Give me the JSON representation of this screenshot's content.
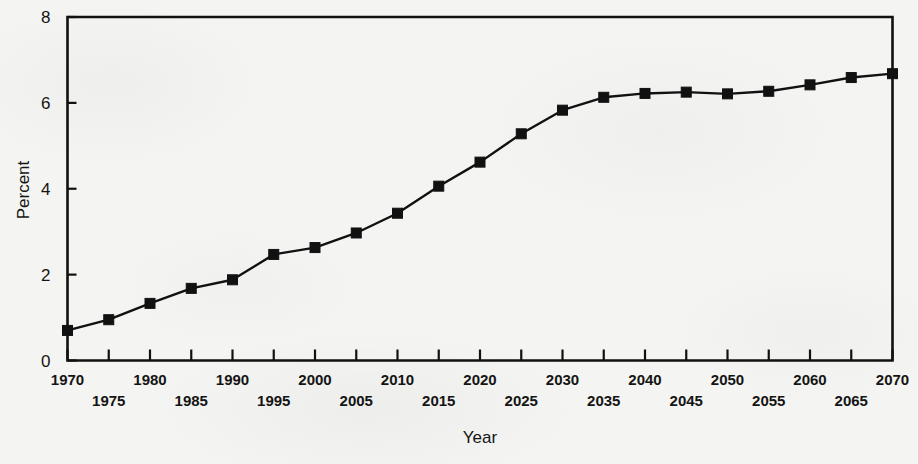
{
  "chart_data": {
    "type": "line",
    "title": "",
    "xlabel": "Year",
    "ylabel": "Percent",
    "xlim": [
      1970,
      2070
    ],
    "ylim": [
      0,
      8
    ],
    "ytick_values": [
      0,
      2,
      4,
      6,
      8
    ],
    "ytick_labels": [
      "0",
      "2",
      "4",
      "6",
      "8"
    ],
    "xtick_values": [
      1970,
      1975,
      1980,
      1985,
      1990,
      1995,
      2000,
      2005,
      2010,
      2015,
      2020,
      2025,
      2030,
      2035,
      2040,
      2045,
      2050,
      2055,
      2060,
      2065,
      2070
    ],
    "xtick_labels_upper": [
      "1970",
      "",
      "1980",
      "",
      "1990",
      "",
      "2000",
      "",
      "2010",
      "",
      "2020",
      "",
      "2030",
      "",
      "2040",
      "",
      "2050",
      "",
      "2060",
      "",
      "2070"
    ],
    "xtick_labels_lower": [
      "",
      "1975",
      "",
      "1985",
      "",
      "1995",
      "",
      "2005",
      "",
      "2015",
      "",
      "2025",
      "",
      "2035",
      "",
      "2045",
      "",
      "2055",
      "",
      "2065",
      ""
    ],
    "grid": false,
    "legend": null,
    "marker": "square",
    "line_color": "#111111",
    "marker_color": "#111111",
    "x": [
      1970,
      1975,
      1980,
      1985,
      1990,
      1995,
      2000,
      2005,
      2010,
      2015,
      2020,
      2025,
      2030,
      2035,
      2040,
      2045,
      2050,
      2055,
      2060,
      2065,
      2070
    ],
    "values": [
      0.7,
      0.95,
      1.33,
      1.68,
      1.88,
      2.47,
      2.63,
      2.97,
      3.43,
      4.06,
      4.62,
      5.28,
      5.83,
      6.13,
      6.22,
      6.25,
      6.21,
      6.27,
      6.42,
      6.59,
      6.68
    ],
    "series": [
      {
        "name": "Percent",
        "values": [
          0.7,
          0.95,
          1.33,
          1.68,
          1.88,
          2.47,
          2.63,
          2.97,
          3.43,
          4.06,
          4.62,
          5.28,
          5.83,
          6.13,
          6.22,
          6.25,
          6.21,
          6.27,
          6.42,
          6.59,
          6.68
        ]
      }
    ]
  },
  "figure": {
    "background_color": "#f4f4f2",
    "ink_color": "#111111"
  }
}
